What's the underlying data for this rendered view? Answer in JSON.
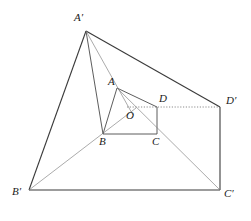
{
  "figure": {
    "type": "geometry-diagram",
    "width": 251,
    "height": 221,
    "background_color": "#ffffff",
    "stroke_color": "#3a3a3a",
    "thin_stroke_color": "#6e6e6e",
    "dotted_stroke_color": "#6e6e6e",
    "label_color": "#1a1a1a",
    "labels": [
      {
        "id": "A-prime",
        "text": "A′",
        "x": 74,
        "y": 12
      },
      {
        "id": "A",
        "text": "A",
        "x": 108,
        "y": 76
      },
      {
        "id": "D",
        "text": "D",
        "x": 159,
        "y": 93
      },
      {
        "id": "D-prime",
        "text": "D′",
        "x": 226,
        "y": 95
      },
      {
        "id": "O",
        "text": "O",
        "x": 126,
        "y": 110
      },
      {
        "id": "B",
        "text": "B",
        "x": 99,
        "y": 136
      },
      {
        "id": "C",
        "text": "C",
        "x": 152,
        "y": 136
      },
      {
        "id": "B-prime",
        "text": "B′",
        "x": 12,
        "y": 186
      },
      {
        "id": "C-prime",
        "text": "C′",
        "x": 224,
        "y": 188
      }
    ],
    "points": {
      "A": {
        "x": 117,
        "y": 88
      },
      "B": {
        "x": 103,
        "y": 134
      },
      "C": {
        "x": 157,
        "y": 134
      },
      "D": {
        "x": 157,
        "y": 107
      },
      "O": {
        "x": 130,
        "y": 112
      },
      "Ap": {
        "x": 86,
        "y": 31
      },
      "Bp": {
        "x": 29,
        "y": 190
      },
      "Cp": {
        "x": 220,
        "y": 190
      },
      "Dp": {
        "x": 220,
        "y": 107
      }
    },
    "segments": [
      {
        "id": "seg-A-B",
        "from": "A",
        "to": "B",
        "style": "solid",
        "weight": "normal"
      },
      {
        "id": "seg-B-C",
        "from": "B",
        "to": "C",
        "style": "solid",
        "weight": "normal"
      },
      {
        "id": "seg-C-D",
        "from": "C",
        "to": "D",
        "style": "solid",
        "weight": "normal"
      },
      {
        "id": "seg-A-D",
        "from": "A",
        "to": "D",
        "style": "solid",
        "weight": "normal"
      },
      {
        "id": "seg-Ap-Bp",
        "from": "Ap",
        "to": "Bp",
        "style": "solid",
        "weight": "normal"
      },
      {
        "id": "seg-Bp-Cp",
        "from": "Bp",
        "to": "Cp",
        "style": "solid",
        "weight": "normal"
      },
      {
        "id": "seg-Cp-Dp",
        "from": "Cp",
        "to": "Dp",
        "style": "solid",
        "weight": "normal"
      },
      {
        "id": "seg-Ap-Dp",
        "from": "Ap",
        "to": "Dp",
        "style": "solid",
        "weight": "normal"
      },
      {
        "id": "seg-Ap-A",
        "from": "Ap",
        "to": "B",
        "style": "solid",
        "weight": "thin"
      },
      {
        "id": "seg-Ap-O",
        "from": "Ap",
        "to": "O",
        "style": "thin",
        "weight": "thin"
      },
      {
        "id": "seg-Bp-O",
        "from": "Bp",
        "to": "O",
        "style": "thin",
        "weight": "thin"
      },
      {
        "id": "seg-Cp-O",
        "from": "Cp",
        "to": "A",
        "style": "thin",
        "weight": "thin"
      },
      {
        "id": "seg-O-Dp",
        "from": "O",
        "to": "Dp",
        "style": "dotted",
        "weight": "thin"
      }
    ]
  }
}
